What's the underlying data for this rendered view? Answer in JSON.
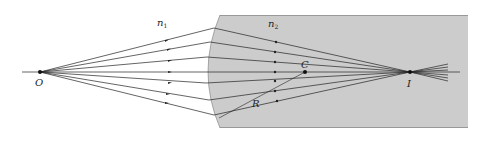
{
  "diagram": {
    "labels": {
      "n1": "n",
      "n1_sub": "1",
      "n2": "n",
      "n2_sub": "2",
      "object": "O",
      "image": "I",
      "center": "C",
      "radius": "R"
    },
    "colors": {
      "medium2_fill": "#cccccc",
      "rays": "#222222",
      "background": "#ffffff"
    },
    "points": {
      "O": [
        40,
        72
      ],
      "C": [
        305,
        72
      ],
      "I": [
        410,
        72
      ]
    },
    "ray_count": 7
  }
}
